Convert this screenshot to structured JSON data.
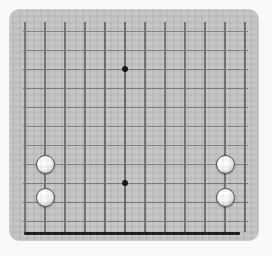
{
  "scene": {
    "title": "Go Board",
    "kind": "go-board",
    "page_background": "#fbfbfa",
    "board": {
      "color": "#c3c3c3",
      "x": 10,
      "y": 10,
      "width": 248,
      "height": 230,
      "corner_radius": 9
    }
  },
  "grid": {
    "line_color_vertical": "#6e6e6e",
    "line_color_horizontal": "#7c7c7c",
    "vertical_count": 12,
    "horizontal_count": 11,
    "vertical_spacing": 20,
    "horizontal_spacing": 19,
    "vertical_x": [
      25,
      45,
      65,
      85,
      105,
      125,
      145,
      165,
      185,
      205,
      225,
      245
    ],
    "vertical_top": 22,
    "vertical_bottom": 232,
    "horizontal_y": [
      31,
      50,
      69,
      88,
      107,
      126,
      145,
      164,
      183,
      202,
      221
    ],
    "horizontal_left": 23,
    "horizontal_right": 248
  },
  "bottom_edge": {
    "label": "board-bottom-boundary",
    "color": "#1a1a1a",
    "thickness": 3,
    "x1": 24,
    "x2": 240,
    "y": 232
  },
  "star_points": [
    {
      "label": "star-point-upper-center",
      "x": 125,
      "y": 69,
      "color": "#121212",
      "size": 6
    },
    {
      "label": "star-point-lower-center",
      "x": 125,
      "y": 183,
      "color": "#121212",
      "size": 6
    }
  ],
  "stones": [
    {
      "id": "stone-1",
      "color": "white",
      "label": "white-stone-left-upper",
      "cx": 45,
      "cy": 164,
      "diameter": 19
    },
    {
      "id": "stone-2",
      "color": "white",
      "label": "white-stone-left-lower",
      "cx": 45,
      "cy": 197,
      "diameter": 19
    },
    {
      "id": "stone-3",
      "color": "white",
      "label": "white-stone-right-upper",
      "cx": 225,
      "cy": 164,
      "diameter": 19
    },
    {
      "id": "stone-4",
      "color": "white",
      "label": "white-stone-right-lower",
      "cx": 225,
      "cy": 197,
      "diameter": 19
    }
  ],
  "counts": {
    "white_stones": 4,
    "black_stones": 0,
    "star_points": 2
  }
}
